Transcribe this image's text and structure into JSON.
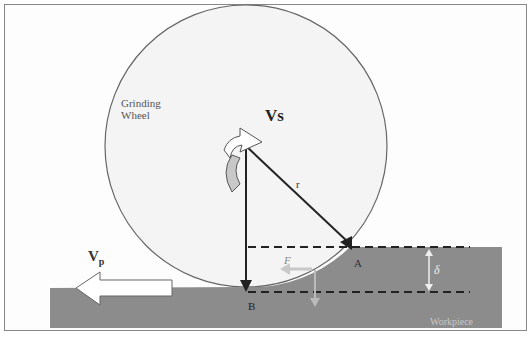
{
  "diagram": {
    "wheel_label_line1": "Grinding",
    "wheel_label_line2": "Wheel",
    "wheel_speed_label": "Vs",
    "radius_label": "r",
    "point_a_label": "A",
    "point_b_label": "B",
    "force_label": "F",
    "depth_label": "δ",
    "feed_velocity_label": "V",
    "feed_velocity_subscript": "p",
    "workpiece_label": "Workpiece",
    "colors": {
      "wheel_fill": "#f4f4f4",
      "wheel_stroke": "#666666",
      "workpiece_fill": "#8c8c8c",
      "arrow_gray": "#bdbdbd",
      "line_dark": "#222222"
    }
  }
}
